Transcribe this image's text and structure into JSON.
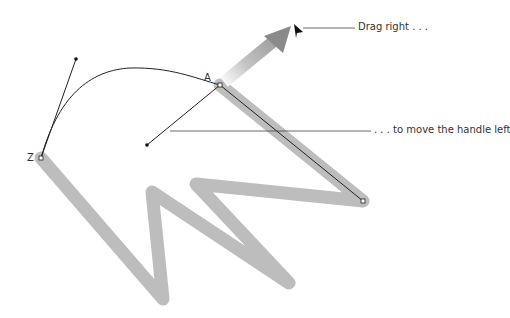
{
  "annotations": {
    "drag": "Drag right . . .",
    "handle": ". . . to move the handle left"
  },
  "points": {
    "start": "A",
    "end": "Z"
  },
  "colors": {
    "stroke": "#bdbdbd",
    "path": "#222222",
    "arrow_start": "#ffffff",
    "arrow_end": "#8a8a8a"
  },
  "icons": {
    "cursor": "arrow-pointer",
    "drag_arrow": "gradient-arrow"
  }
}
